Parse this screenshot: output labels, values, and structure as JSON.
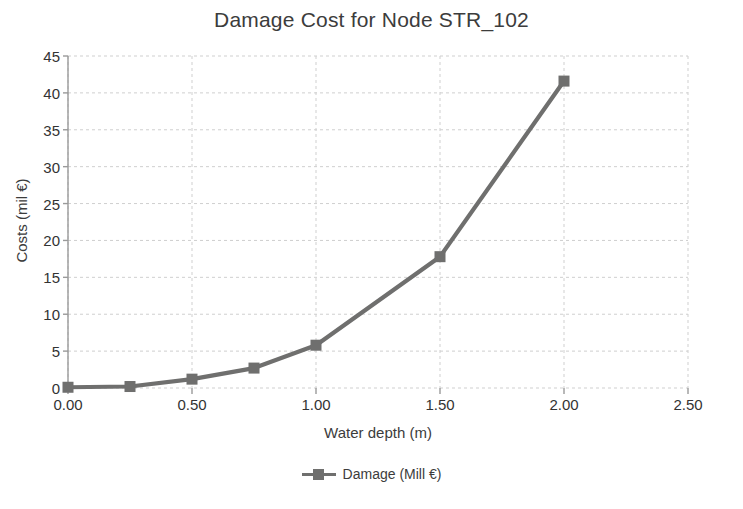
{
  "chart_data": {
    "type": "line",
    "title": "Damage Cost for Node STR_102",
    "xlabel": "Water depth (m)",
    "ylabel": "Costs (mil €)",
    "xlim": [
      0.0,
      2.5
    ],
    "ylim": [
      0,
      45
    ],
    "xticks": [
      "0.00",
      "0.50",
      "1.00",
      "1.50",
      "2.00",
      "2.50"
    ],
    "xtick_values": [
      0.0,
      0.5,
      1.0,
      1.5,
      2.0,
      2.5
    ],
    "yticks": [
      "0",
      "5",
      "10",
      "15",
      "20",
      "25",
      "30",
      "35",
      "40",
      "45"
    ],
    "ytick_values": [
      0,
      5,
      10,
      15,
      20,
      25,
      30,
      35,
      40,
      45
    ],
    "grid": true,
    "grid_style": "dashed",
    "legend_position": "bottom",
    "series": [
      {
        "name": "Damage (Mill €)",
        "color": "#6f6f6e",
        "marker": "square",
        "x": [
          0.0,
          0.25,
          0.5,
          0.75,
          1.0,
          1.5,
          2.0
        ],
        "values": [
          0.1,
          0.2,
          1.2,
          2.7,
          5.8,
          17.8,
          41.6
        ]
      }
    ]
  },
  "legend": {
    "entries": [
      {
        "label": "Damage (Mill €)",
        "color": "#6f6f6e"
      }
    ]
  },
  "colors": {
    "series": "#6f6f6e",
    "grid": "#cfcfcf",
    "axis": "#9a9a9a",
    "text": "#3c3c3c",
    "background": "#ffffff"
  }
}
